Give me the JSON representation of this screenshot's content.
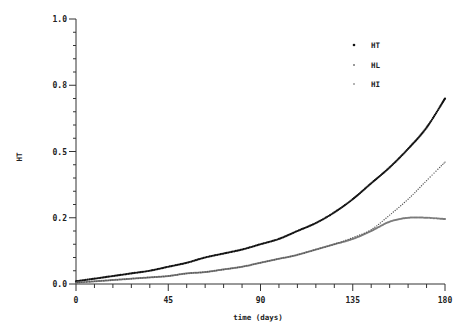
{
  "chart_data": {
    "type": "scatter",
    "title": "",
    "xlabel": "time (days)",
    "ylabel": "HT",
    "xlim": [
      0,
      180
    ],
    "ylim": [
      0,
      1.0
    ],
    "x_ticks": [
      0,
      45,
      90,
      135,
      180
    ],
    "x_tick_labels": [
      "0",
      "45",
      "90",
      "135",
      "180"
    ],
    "y_ticks": [
      0,
      0.25,
      0.5,
      0.75,
      1.0
    ],
    "y_tick_labels": [
      "0.0",
      "0.2",
      "0.5",
      "0.8",
      "1.0"
    ],
    "grid": false,
    "legend_position": "upper right",
    "x": [
      0,
      9,
      18,
      27,
      36,
      45,
      54,
      63,
      72,
      81,
      90,
      99,
      108,
      117,
      126,
      135,
      144,
      153,
      162,
      171,
      180
    ],
    "series": [
      {
        "name": "HT",
        "color": "#111111",
        "marker": "dot",
        "values": [
          0.01,
          0.02,
          0.03,
          0.04,
          0.05,
          0.065,
          0.08,
          0.1,
          0.115,
          0.13,
          0.15,
          0.17,
          0.2,
          0.23,
          0.27,
          0.32,
          0.38,
          0.44,
          0.51,
          0.59,
          0.7
        ]
      },
      {
        "name": "HL",
        "color": "#7a7a7a",
        "marker": "dot",
        "values": [
          0.005,
          0.01,
          0.015,
          0.02,
          0.025,
          0.03,
          0.04,
          0.045,
          0.055,
          0.065,
          0.08,
          0.095,
          0.11,
          0.13,
          0.15,
          0.17,
          0.2,
          0.235,
          0.25,
          0.25,
          0.245
        ]
      },
      {
        "name": "HI",
        "color": "#555555",
        "marker": "small-dot",
        "values": [
          0.005,
          0.01,
          0.015,
          0.02,
          0.025,
          0.03,
          0.04,
          0.045,
          0.055,
          0.065,
          0.08,
          0.095,
          0.11,
          0.13,
          0.15,
          0.175,
          0.205,
          0.26,
          0.32,
          0.39,
          0.46
        ]
      }
    ]
  },
  "legend": {
    "items": [
      {
        "label": "HT"
      },
      {
        "label": "HL"
      },
      {
        "label": "HI"
      }
    ]
  }
}
